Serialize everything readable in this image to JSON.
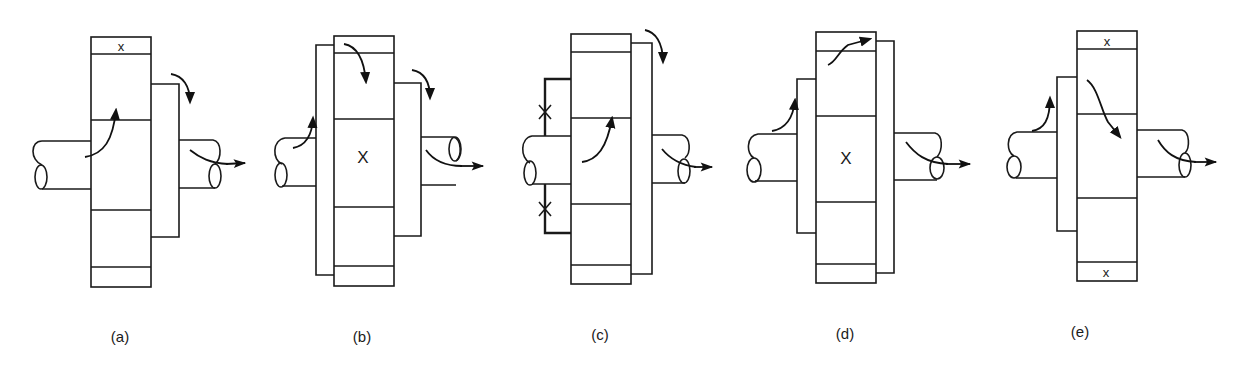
{
  "figure": {
    "stroke_color": "#1a1a1a",
    "background": "#ffffff"
  },
  "panels": [
    {
      "id": "a",
      "label": "(a)",
      "fixed_marks": [
        "top-cap"
      ],
      "mark_glyph": "x"
    },
    {
      "id": "b",
      "label": "(b)",
      "fixed_marks": [
        "center-section"
      ],
      "mark_glyph": "X"
    },
    {
      "id": "c",
      "label": "(c)",
      "fixed_marks": [
        "bracket-upper",
        "bracket-lower"
      ],
      "mark_glyph": "X"
    },
    {
      "id": "d",
      "label": "(d)",
      "fixed_marks": [
        "center-section"
      ],
      "mark_glyph": "X"
    },
    {
      "id": "e",
      "label": "(e)",
      "fixed_marks": [
        "top-cap",
        "bottom-cap"
      ],
      "mark_glyph": "x"
    }
  ]
}
